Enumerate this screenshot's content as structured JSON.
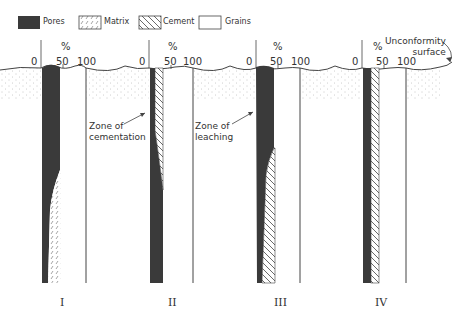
{
  "legend": {
    "pores": "Pores",
    "matrix": "Matrix",
    "cement": "Cement",
    "grains": "Grains"
  },
  "axis": {
    "unit": "%",
    "tick_0": "0",
    "tick_50": "50",
    "tick_100": "100"
  },
  "annotations": {
    "unconformity_line1": "Unconformity",
    "unconformity_line2": "surface",
    "cementation_line1": "Zone of",
    "cementation_line2": "cementation",
    "leaching_line1": "Zone of",
    "leaching_line2": "leaching"
  },
  "columns": [
    {
      "label": "I",
      "description": "Pores high near top, decreasing downward as matrix fills pore space"
    },
    {
      "label": "II",
      "description": "Cement fills upper pore space (zone of cementation), pores dominate below"
    },
    {
      "label": "III",
      "description": "Pores high in upper zone of leaching, cement increasing below"
    },
    {
      "label": "IV",
      "description": "Constant narrow pores plus cement throughout"
    }
  ],
  "colors": {
    "pores": "#3a3a3a",
    "line": "#444444",
    "background": "#ffffff"
  }
}
